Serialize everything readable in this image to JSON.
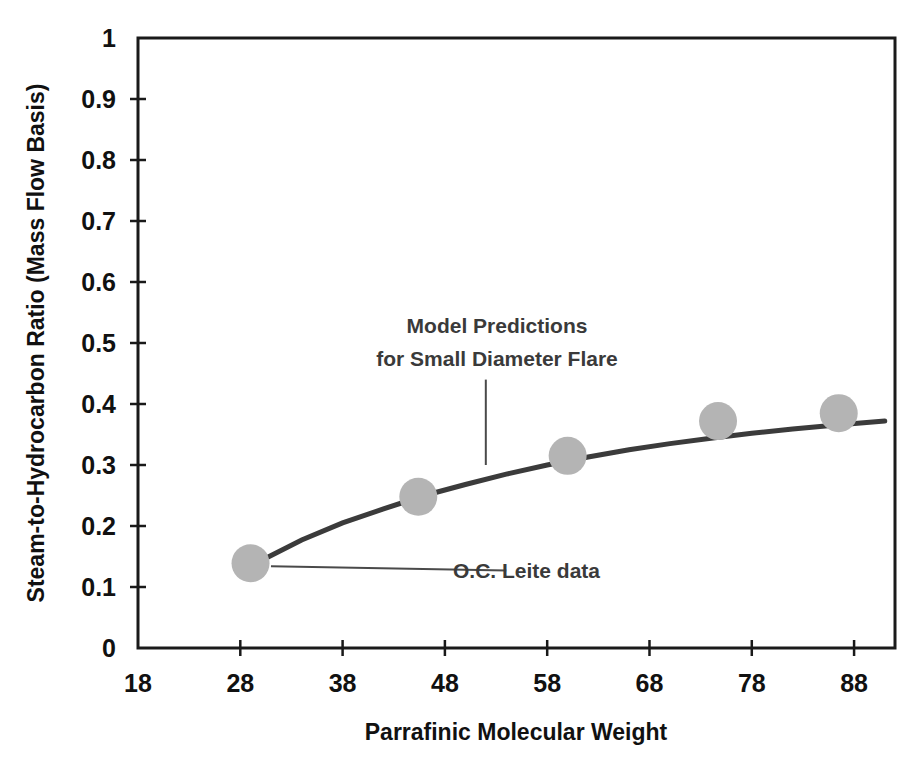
{
  "chart_data": {
    "type": "scatter",
    "title": "",
    "subtitle": "",
    "xlabel": "Parrafinic Molecular Weight",
    "ylabel": "Steam-to-Hydrocarbon Ratio (Mass Flow Basis)",
    "xlim": [
      18,
      92
    ],
    "ylim": [
      0,
      1
    ],
    "grid": false,
    "legend_position": "none",
    "xticks": [
      18,
      28,
      38,
      48,
      58,
      68,
      78,
      88
    ],
    "xtick_labels": [
      "18",
      "28",
      "38",
      "48",
      "58",
      "68",
      "78",
      "88"
    ],
    "yticks": [
      0,
      0.1,
      0.2,
      0.3,
      0.4,
      0.5,
      0.6,
      0.7,
      0.8,
      0.9,
      1
    ],
    "ytick_labels": [
      "0",
      "0.1",
      "0.2",
      "0.3",
      "0.4",
      "0.5",
      "0.6",
      "0.7",
      "0.8",
      "0.9",
      "1"
    ],
    "series": [
      {
        "name": "O.C. Leite data",
        "kind": "scatter",
        "marker": "circle",
        "color": "#b4b4b4",
        "points": [
          {
            "x": 29.0,
            "y": 0.139
          },
          {
            "x": 45.4,
            "y": 0.248
          },
          {
            "x": 60.0,
            "y": 0.315
          },
          {
            "x": 74.7,
            "y": 0.372
          },
          {
            "x": 86.5,
            "y": 0.385
          }
        ]
      },
      {
        "name": "Model Predictions for Small Diameter Flare",
        "kind": "line",
        "color": "#3b3b3b",
        "points": [
          {
            "x": 30.0,
            "y": 0.143
          },
          {
            "x": 34.0,
            "y": 0.177
          },
          {
            "x": 38.0,
            "y": 0.205
          },
          {
            "x": 42.0,
            "y": 0.228
          },
          {
            "x": 46.0,
            "y": 0.25
          },
          {
            "x": 50.0,
            "y": 0.268
          },
          {
            "x": 54.0,
            "y": 0.285
          },
          {
            "x": 58.0,
            "y": 0.3
          },
          {
            "x": 62.0,
            "y": 0.313
          },
          {
            "x": 66.0,
            "y": 0.325
          },
          {
            "x": 70.0,
            "y": 0.335
          },
          {
            "x": 74.0,
            "y": 0.344
          },
          {
            "x": 78.0,
            "y": 0.352
          },
          {
            "x": 82.0,
            "y": 0.359
          },
          {
            "x": 86.0,
            "y": 0.365
          },
          {
            "x": 91.0,
            "y": 0.372
          }
        ]
      }
    ],
    "annotations": [
      {
        "id": "model-annotation",
        "lines": [
          "Model Predictions",
          "for Small Diameter Flare"
        ],
        "text_anchor_x": 52.0,
        "text_anchor_y": 0.52,
        "leader_from": {
          "x": 52.0,
          "y": 0.44
        },
        "leader_to": {
          "x": 52.0,
          "y": 0.3
        }
      },
      {
        "id": "leite-annotation",
        "lines": [
          "O.C. Leite data"
        ],
        "text_anchor_x": 56.0,
        "text_anchor_y": 0.124,
        "leader_from": {
          "x": 54.0,
          "y": 0.127
        },
        "leader_to": {
          "x": 31.0,
          "y": 0.134
        }
      }
    ]
  },
  "labels": {
    "y_axis_title": "Steam-to-Hydrocarbon Ratio (Mass Flow Basis)",
    "x_axis_title": "Parrafinic Molecular Weight",
    "annotation_model_line1": "Model Predictions",
    "annotation_model_line2": "for Small Diameter Flare",
    "annotation_leite": "O.C. Leite data"
  },
  "colors": {
    "marker": "#b4b4b4",
    "curve": "#3b3b3b",
    "axis": "#1a1a1a",
    "text": "#111111",
    "annotation_text": "#3a3a3a",
    "background": "#ffffff"
  },
  "geometry": {
    "plot_left": 138,
    "plot_right": 895,
    "plot_top": 38,
    "plot_bottom": 648,
    "marker_radius": 19
  }
}
